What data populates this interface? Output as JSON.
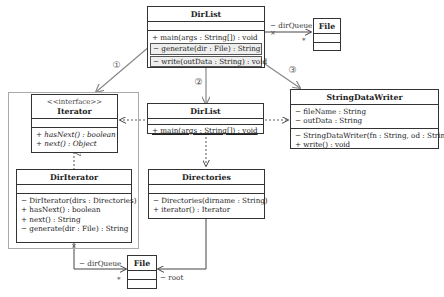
{
  "diagram": {
    "classes": {
      "dirlist_top": {
        "name": "DirList",
        "attributes": [],
        "operations": [
          "+ main(args : String[]) : void",
          "− generate(dir : File) : String",
          "− write(outData : String) : void"
        ]
      },
      "file_top": {
        "name": "File"
      },
      "iterator": {
        "stereotype": "<<interface>>",
        "name": "Iterator",
        "operations": [
          "+ hasNext() : boolean",
          "+ next() : Object"
        ]
      },
      "dirlist_mid": {
        "name": "DirList",
        "operations": [
          "+ main(args : String[]) : void"
        ]
      },
      "stringdatawriter": {
        "name": "StringDataWriter",
        "attributes": [
          "− fileName : String",
          "− outData : String"
        ],
        "operations": [
          "− StringDataWriter(fn : String, od : String)",
          "+ write() : void"
        ]
      },
      "diriterator": {
        "name": "DirIterator",
        "operations": [
          "− DirIterator(dirs : Directories)",
          "+ hasNext() : boolean",
          "+ next() : String",
          "− generate(dir : File) : String"
        ]
      },
      "directories": {
        "name": "Directories",
        "operations": [
          "− Directories(dirname : String)",
          "+ iterator() : Iterator"
        ]
      },
      "file_bottom": {
        "name": "File"
      }
    },
    "labels": {
      "dirqueue_top": "− dirQueue",
      "mult_top": "*",
      "dirqueue_bottom": "− dirQueue",
      "mult_bottom": "*",
      "root": "− root"
    },
    "step_markers": [
      "①",
      "②",
      "③"
    ],
    "colors": {
      "line": "#333333",
      "arrow_gray": "#888888",
      "frame": "#aaaaaa",
      "highlight": "#eeeeee"
    }
  }
}
